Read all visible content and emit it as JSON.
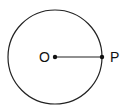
{
  "diagram": {
    "type": "circle-with-radius",
    "circle": {
      "cx": 55,
      "cy": 57,
      "r": 47,
      "stroke": "#222222"
    },
    "center_point": {
      "label": "O",
      "x": 55,
      "y": 57
    },
    "circumference_point": {
      "label": "P",
      "x": 102,
      "y": 57
    },
    "segment": {
      "from": "O",
      "to": "P"
    }
  }
}
